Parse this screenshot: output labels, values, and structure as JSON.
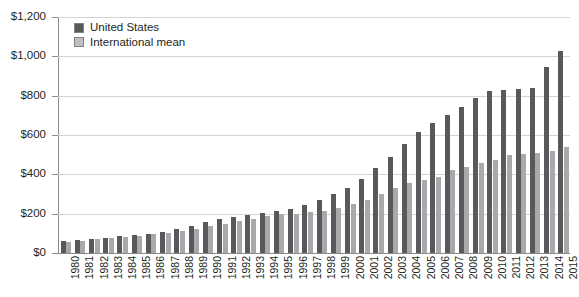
{
  "chart_data": {
    "type": "bar",
    "title": "",
    "subtitle": "",
    "xlabel": "",
    "ylabel": "",
    "ylim": [
      0,
      1200
    ],
    "ytick_values": [
      0,
      200,
      400,
      600,
      800,
      1000,
      1200
    ],
    "ytick_labels": [
      "$0",
      "$200",
      "$400",
      "$600",
      "$800",
      "$1,000",
      "$1,200"
    ],
    "grid": true,
    "legend_position": "top-left",
    "categories": [
      "1980",
      "1981",
      "1982",
      "1983",
      "1984",
      "1985",
      "1986",
      "1987",
      "1988",
      "1989",
      "1990",
      "1991",
      "1992",
      "1993",
      "1994",
      "1995",
      "1996",
      "1997",
      "1998",
      "1999",
      "2000",
      "2001",
      "2002",
      "2003",
      "2004",
      "2005",
      "2006",
      "2007",
      "2008",
      "2009",
      "2010",
      "2011",
      "2012",
      "2013",
      "2014",
      "2015"
    ],
    "series": [
      {
        "name": "United States",
        "color": "#58595b",
        "values": [
          60,
          65,
          72,
          78,
          85,
          92,
          98,
          108,
          120,
          135,
          160,
          175,
          185,
          195,
          205,
          215,
          225,
          245,
          270,
          300,
          330,
          375,
          430,
          490,
          555,
          615,
          660,
          700,
          740,
          790,
          825,
          830,
          835,
          840,
          945,
          1025
        ]
      },
      {
        "name": "International mean",
        "color": "#a7a9ac",
        "values": [
          55,
          62,
          70,
          76,
          83,
          88,
          95,
          100,
          110,
          120,
          135,
          150,
          165,
          175,
          190,
          198,
          200,
          208,
          215,
          230,
          248,
          270,
          300,
          330,
          355,
          370,
          385,
          420,
          435,
          460,
          475,
          500,
          505,
          510,
          520,
          540
        ]
      }
    ]
  },
  "legend": {
    "items": [
      {
        "label": "United States",
        "swatch": "legend-swatch-dark"
      },
      {
        "label": "International mean",
        "swatch": "legend-swatch-light"
      }
    ]
  }
}
